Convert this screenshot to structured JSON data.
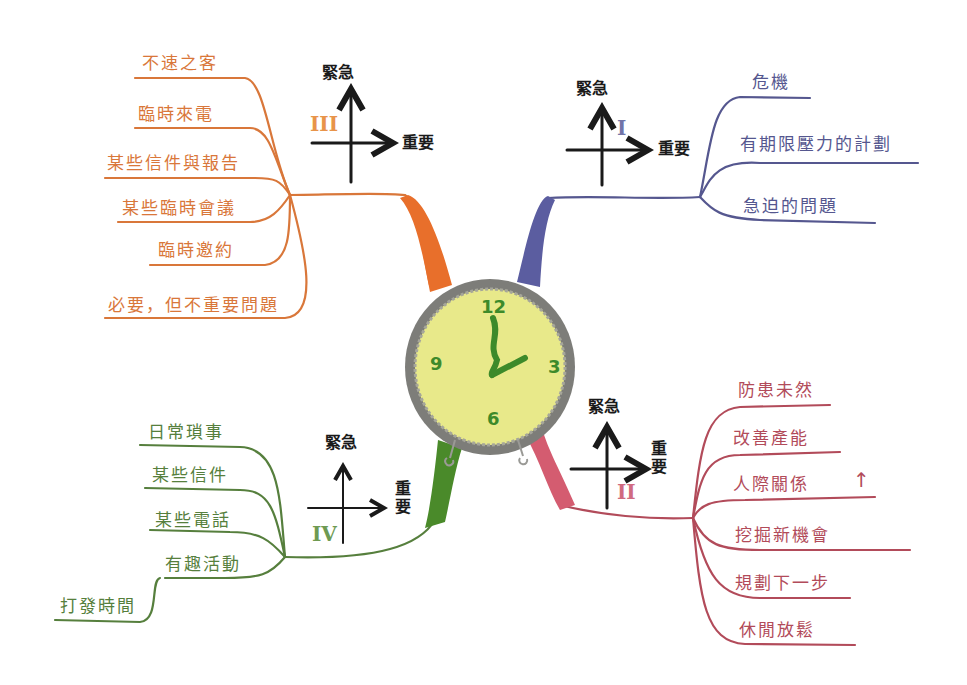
{
  "center": {
    "type": "clock",
    "numbers": [
      "12",
      "3",
      "6",
      "9"
    ],
    "face_color": "#e8e98a",
    "rim_color": "#8a8a86",
    "hand_color": "#3d8a2a"
  },
  "colors": {
    "quadrant_1": "#55578f",
    "quadrant_2": "#b24b5a",
    "quadrant_3": "#d9773a",
    "quadrant_4": "#567f3d",
    "axes": "#1a1a1a"
  },
  "quadrants": {
    "q1": {
      "numeral": "I",
      "axis_urgent": "緊急",
      "axis_important": "重要",
      "items": [
        "危機",
        "有期限壓力的計劃",
        "急迫的問題"
      ]
    },
    "q2": {
      "numeral": "II",
      "axis_urgent": "緊急",
      "axis_important": "重要",
      "items": [
        "防患未然",
        "改善產能",
        "人際關係",
        "挖掘新機會",
        "規劃下一步",
        "休閒放鬆"
      ],
      "arrow": "↑"
    },
    "q3": {
      "numeral": "III",
      "axis_urgent": "緊急",
      "axis_important": "重要",
      "items": [
        "不速之客",
        "臨時來電",
        "某些信件與報告",
        "某些臨時會議",
        "臨時邀約",
        "必要，但不重要問題"
      ]
    },
    "q4": {
      "numeral": "IV",
      "axis_urgent": "緊急",
      "axis_important": "重要",
      "items": [
        "日常瑣事",
        "某些信件",
        "某些電話",
        "有趣活動",
        "打發時間"
      ]
    }
  }
}
